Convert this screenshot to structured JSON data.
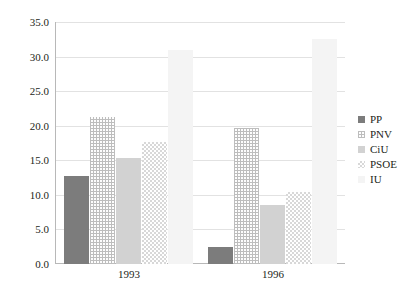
{
  "chart_data": {
    "type": "bar",
    "title": "",
    "subtitle": "",
    "xlabel": "",
    "ylabel": "",
    "categories": [
      "1993",
      "1996"
    ],
    "series": [
      {
        "name": "PP",
        "values": [
          12.8,
          2.4
        ],
        "color": "#7c7c7c",
        "fill": "solid-dark-gray"
      },
      {
        "name": "PNV",
        "values": [
          21.2,
          19.6
        ],
        "color": "#bdbdbd",
        "fill": "fine-crosshatch"
      },
      {
        "name": "CiU",
        "values": [
          15.3,
          8.5
        ],
        "color": "#d2d2d2",
        "fill": "solid-light-gray"
      },
      {
        "name": "PSOE",
        "values": [
          17.7,
          10.4
        ],
        "color": "#d8d8d8",
        "fill": "checkerboard"
      },
      {
        "name": "IU",
        "values": [
          31.0,
          32.6
        ],
        "color": "#f4f4f4",
        "fill": "solid-very-light"
      }
    ],
    "ylim": [
      0.0,
      35.0
    ],
    "ytick_step": 5.0,
    "yticks": [
      "0.0",
      "5.0",
      "10.0",
      "15.0",
      "20.0",
      "25.0",
      "30.0",
      "35.0"
    ],
    "grid": true,
    "legend_position": "right"
  },
  "axis": {
    "y_tick_labels": [
      "35.0",
      "30.0",
      "25.0",
      "20.0",
      "15.0",
      "10.0",
      "5.0",
      "0.0"
    ],
    "x_tick_labels": [
      "1993",
      "1996"
    ]
  },
  "legend": {
    "entries": [
      {
        "label": "PP"
      },
      {
        "label": "PNV"
      },
      {
        "label": "CiU"
      },
      {
        "label": "PSOE"
      },
      {
        "label": "IU"
      }
    ]
  }
}
